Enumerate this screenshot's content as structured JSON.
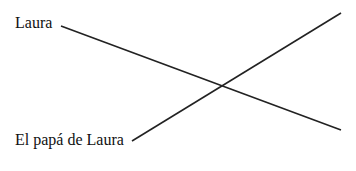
{
  "labels": {
    "top": "Laura",
    "bottom": "El papá de Laura"
  },
  "lines": [
    {
      "from": "Laura",
      "x1": 61,
      "y1": 26,
      "x2": 341,
      "y2": 130
    },
    {
      "from": "El papá de Laura",
      "x1": 132,
      "y1": 141,
      "x2": 341,
      "y2": 13
    }
  ],
  "colors": {
    "line": "#222222",
    "text": "#111111"
  }
}
